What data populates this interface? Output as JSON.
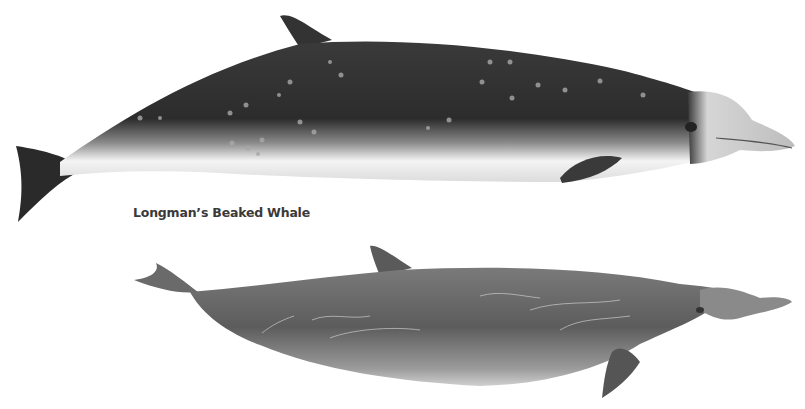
{
  "illustration": {
    "label": "Longman’s Beaked Whale",
    "figures": [
      {
        "name": "top-whale",
        "description": "dark dorsal with pale spots, white belly, pale head and beak"
      },
      {
        "name": "bottom-whale",
        "description": "uniform grey with pale linear scars"
      }
    ],
    "colors": {
      "background": "#ffffff",
      "dark_body": "#2e2e2e",
      "mid_grey": "#6a6a6a",
      "belly": "#f2f2f2",
      "label_text": "#3a3a3a"
    }
  }
}
